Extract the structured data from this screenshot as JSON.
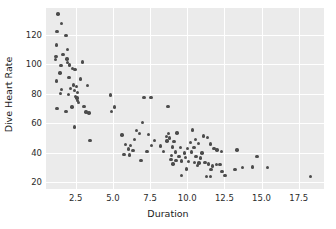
{
  "chart_data": {
    "type": "scatter",
    "title": "",
    "xlabel": "Duration",
    "ylabel": "Dive Heart Rate",
    "xlim": [
      0.5,
      19.2
    ],
    "ylim": [
      15.5,
      138.0
    ],
    "grid": true,
    "legend": null,
    "xticks": [
      2.5,
      5.0,
      7.5,
      10.0,
      12.5,
      15.0,
      17.5
    ],
    "xtick_labels": [
      "2.5",
      "5.0",
      "7.5",
      "10.0",
      "12.5",
      "15.0",
      "17.5"
    ],
    "yticks": [
      20,
      40,
      60,
      80,
      100,
      120
    ],
    "ytick_labels": [
      "20",
      "40",
      "60",
      "80",
      "100",
      "120"
    ],
    "marker_color": "#4c4c4c",
    "panel_color": "#ebebeb",
    "gridline_color": "#ffffff",
    "points": [
      [
        1.3,
        134.0
      ],
      [
        1.55,
        127.5
      ],
      [
        1.25,
        122.0
      ],
      [
        1.85,
        119.5
      ],
      [
        1.2,
        113.0
      ],
      [
        1.95,
        110.0
      ],
      [
        1.65,
        106.5
      ],
      [
        1.18,
        105.0
      ],
      [
        1.15,
        103.0
      ],
      [
        1.9,
        103.5
      ],
      [
        1.95,
        101.0
      ],
      [
        2.95,
        101.5
      ],
      [
        1.5,
        99.0
      ],
      [
        2.1,
        99.5
      ],
      [
        2.3,
        97.0
      ],
      [
        2.45,
        96.5
      ],
      [
        1.45,
        94.0
      ],
      [
        2.05,
        91.0
      ],
      [
        2.8,
        90.0
      ],
      [
        1.22,
        88.5
      ],
      [
        2.35,
        86.0
      ],
      [
        2.55,
        85.0
      ],
      [
        3.3,
        85.5
      ],
      [
        1.55,
        83.0
      ],
      [
        2.15,
        83.5
      ],
      [
        2.4,
        82.0
      ],
      [
        2.6,
        81.0
      ],
      [
        1.48,
        80.0
      ],
      [
        2.0,
        79.5
      ],
      [
        2.5,
        78.0
      ],
      [
        2.58,
        77.0
      ],
      [
        2.62,
        75.5
      ],
      [
        4.85,
        79.0
      ],
      [
        7.1,
        77.5
      ],
      [
        7.55,
        77.5
      ],
      [
        2.7,
        74.0
      ],
      [
        1.25,
        70.0
      ],
      [
        2.25,
        71.0
      ],
      [
        3.05,
        71.5
      ],
      [
        5.1,
        71.0
      ],
      [
        8.7,
        71.5
      ],
      [
        1.85,
        68.0
      ],
      [
        3.2,
        67.5
      ],
      [
        3.4,
        67.0
      ],
      [
        4.9,
        68.0
      ],
      [
        2.4,
        57.5
      ],
      [
        7.0,
        60.5
      ],
      [
        10.35,
        55.5
      ],
      [
        6.6,
        55.0
      ],
      [
        6.8,
        53.0
      ],
      [
        7.4,
        52.5
      ],
      [
        8.75,
        53.0
      ],
      [
        9.3,
        53.5
      ],
      [
        5.6,
        52.0
      ],
      [
        8.6,
        51.0
      ],
      [
        8.8,
        50.0
      ],
      [
        11.1,
        51.5
      ],
      [
        11.35,
        50.5
      ],
      [
        10.55,
        49.0
      ],
      [
        6.45,
        49.0
      ],
      [
        7.8,
        48.5
      ],
      [
        8.65,
        48.0
      ],
      [
        9.1,
        47.5
      ],
      [
        3.45,
        48.5
      ],
      [
        10.2,
        47.0
      ],
      [
        10.75,
        46.5
      ],
      [
        11.55,
        46.0
      ],
      [
        5.85,
        45.5
      ],
      [
        6.2,
        45.0
      ],
      [
        7.6,
        45.0
      ],
      [
        8.2,
        44.5
      ],
      [
        9.0,
        44.0
      ],
      [
        9.55,
        43.5
      ],
      [
        10.0,
        43.0
      ],
      [
        10.45,
        43.5
      ],
      [
        11.8,
        43.0
      ],
      [
        12.0,
        42.0
      ],
      [
        13.35,
        42.0
      ],
      [
        6.05,
        42.5
      ],
      [
        6.35,
        41.5
      ],
      [
        7.3,
        41.0
      ],
      [
        8.4,
        41.0
      ],
      [
        9.2,
        40.5
      ],
      [
        9.8,
        40.0
      ],
      [
        10.3,
        40.5
      ],
      [
        11.0,
        40.0
      ],
      [
        12.3,
        41.0
      ],
      [
        5.75,
        39.0
      ],
      [
        6.1,
        38.5
      ],
      [
        8.95,
        38.0
      ],
      [
        9.45,
        37.5
      ],
      [
        9.9,
        37.0
      ],
      [
        10.6,
        37.5
      ],
      [
        10.9,
        36.5
      ],
      [
        14.7,
        37.5
      ],
      [
        6.9,
        35.0
      ],
      [
        8.9,
        35.5
      ],
      [
        9.25,
        35.0
      ],
      [
        9.6,
        34.5
      ],
      [
        10.1,
        34.0
      ],
      [
        10.5,
        33.5
      ],
      [
        10.8,
        33.0
      ],
      [
        11.2,
        33.5
      ],
      [
        11.45,
        32.5
      ],
      [
        11.95,
        32.0
      ],
      [
        12.2,
        32.0
      ],
      [
        9.05,
        32.5
      ],
      [
        10.7,
        31.5
      ],
      [
        11.7,
        31.0
      ],
      [
        13.7,
        30.0
      ],
      [
        14.4,
        30.5
      ],
      [
        15.4,
        30.0
      ],
      [
        9.95,
        29.0
      ],
      [
        11.6,
        28.5
      ],
      [
        13.2,
        28.5
      ],
      [
        12.35,
        27.5
      ],
      [
        12.55,
        24.5
      ],
      [
        11.3,
        24.0
      ],
      [
        11.55,
        24.0
      ],
      [
        9.6,
        24.5
      ],
      [
        18.3,
        24.0
      ]
    ]
  }
}
